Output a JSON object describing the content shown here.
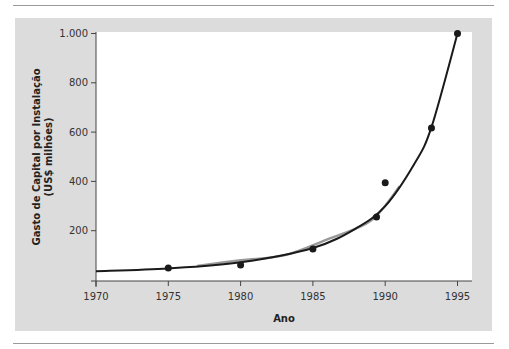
{
  "chart_data": {
    "type": "scatter",
    "title": "",
    "xlabel": "Ano",
    "ylabel_line1": "Gasto de Capital por Instalação",
    "ylabel_line2": "(US$ milhões)",
    "xlim": [
      1970,
      1996
    ],
    "ylim": [
      0,
      1000
    ],
    "x_ticks": [
      1970,
      1975,
      1980,
      1985,
      1990,
      1995
    ],
    "x_tick_labels": [
      "1970",
      "1975",
      "1980",
      "1985",
      "1990",
      "1995"
    ],
    "y_ticks": [
      200,
      400,
      600,
      800,
      1000
    ],
    "y_tick_labels": [
      "200",
      "400",
      "600",
      "800",
      "1.000"
    ],
    "grid": false,
    "legend": null,
    "series": [
      {
        "name": "observed",
        "type": "scatter",
        "color": "#1a1a1a",
        "points": [
          {
            "x": 1975,
            "y": 49
          },
          {
            "x": 1980,
            "y": 61
          },
          {
            "x": 1985,
            "y": 126
          },
          {
            "x": 1989.4,
            "y": 256
          },
          {
            "x": 1990,
            "y": 395
          },
          {
            "x": 1993.2,
            "y": 617
          },
          {
            "x": 1995,
            "y": 1000
          }
        ]
      },
      {
        "name": "exponential-fit",
        "type": "line",
        "color": "#1a1a1a",
        "points": [
          {
            "x": 1970,
            "y": 36
          },
          {
            "x": 1975,
            "y": 47
          },
          {
            "x": 1980,
            "y": 72
          },
          {
            "x": 1985,
            "y": 130
          },
          {
            "x": 1988,
            "y": 210
          },
          {
            "x": 1990,
            "y": 300
          },
          {
            "x": 1992,
            "y": 470
          },
          {
            "x": 1993.2,
            "y": 620
          },
          {
            "x": 1995,
            "y": 1000
          }
        ]
      },
      {
        "name": "smoothed-trend",
        "type": "line",
        "color": "#9a9a9a",
        "points": [
          {
            "x": 1977,
            "y": 57
          },
          {
            "x": 1980,
            "y": 80
          },
          {
            "x": 1983,
            "y": 100
          },
          {
            "x": 1986,
            "y": 165
          },
          {
            "x": 1989,
            "y": 240
          },
          {
            "x": 1991,
            "y": 380
          }
        ]
      }
    ]
  }
}
